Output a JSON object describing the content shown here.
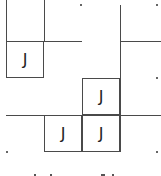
{
  "puzzle": {
    "line_color": "#4a4a4a",
    "cells": [
      {
        "col": 0,
        "row": 1,
        "glyph": "J"
      },
      {
        "col": 2,
        "row": 2,
        "glyph": "J"
      },
      {
        "col": 1,
        "row": 3,
        "glyph": "J"
      },
      {
        "col": 2,
        "row": 3,
        "glyph": "J"
      }
    ],
    "grid_dots": 5
  }
}
